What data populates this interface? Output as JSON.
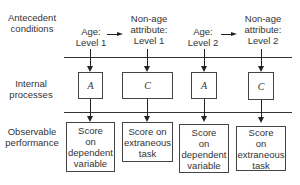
{
  "row_labels": {
    "antecedent": "Antecedent conditions",
    "internal": "Internal processes",
    "observable": "Observable performance"
  },
  "columns": [
    {
      "condition": [
        "Age:",
        "Level 1"
      ],
      "process": "A",
      "performance": [
        "Score",
        "on",
        "dependent",
        "variable"
      ]
    },
    {
      "condition": [
        "Non-age",
        "attribute:",
        "Level 1"
      ],
      "process": "C",
      "performance": [
        "Score on",
        "extraneous",
        "task"
      ]
    },
    {
      "condition": [
        "Age:",
        "Level 2"
      ],
      "process": "A",
      "performance": [
        "Score",
        "on",
        "dependent",
        "variable"
      ]
    },
    {
      "condition": [
        "Non-age",
        "attribute:",
        "Level 2"
      ],
      "process": "C",
      "performance": [
        "Score",
        "on",
        "extraneous",
        "task"
      ]
    }
  ]
}
